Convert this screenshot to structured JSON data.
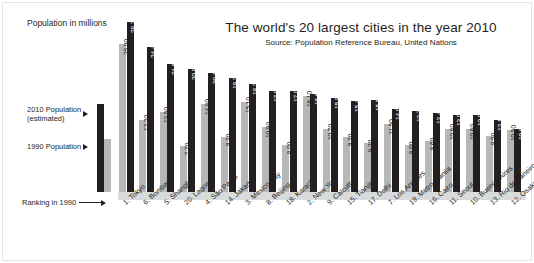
{
  "header": {
    "title": "The world's 20 largest cities in the year 2010",
    "source": "Source: Population Reference Bureau, United Nations"
  },
  "axis": {
    "y_caption": "Population in millions",
    "ranking_caption": "Ranking in 1990"
  },
  "legend": {
    "series_2010_line1": "2010 Population",
    "series_2010_line2": "(estimated)",
    "series_1990": "1990 Population",
    "color_2010": "#231f20",
    "color_1990": "#b6b7b9"
  },
  "chart_data": {
    "type": "bar",
    "title": "The world's 20 largest cities in the year 2010",
    "subtitle": "Source: Population Reference Bureau, United Nations",
    "xlabel": "Ranking in 1990",
    "ylabel": "Population in millions",
    "ylim": [
      0,
      30
    ],
    "grid": false,
    "legend_position": "left",
    "categories": [
      "1. Tokyo",
      "6. Bombay",
      "5. Shanghai",
      "20. Lagos",
      "4. São Paulo",
      "14. Jakarta",
      "3. Mexico City",
      "8. Beijing",
      "18. Karachi",
      "2. New York",
      "9. Calcutta",
      "15. Tianjin",
      "17. Delhi",
      "7. Los Angeles",
      "19. Metro Manila",
      "16. Cairo",
      "11. Seoul",
      "10. Buenos Aires",
      "13. Rio de Janeiro",
      "12. Osaka"
    ],
    "series": [
      {
        "name": "1990 Population",
        "color": "#b6b7b9",
        "values": [
          25.0,
          12.2,
          13.5,
          7.7,
          14.8,
          9.3,
          15.1,
          10.9,
          8.0,
          16.1,
          10.7,
          9.3,
          8.2,
          11.5,
          8.0,
          8.6,
          10.6,
          10.6,
          9.5,
          10.5
        ],
        "labels": [
          "25.00",
          "12.20",
          "13.50",
          "7.70",
          "14.80",
          "9.30",
          "15.10",
          "10.90",
          "8.00",
          "16.10",
          "10.70",
          "9.30",
          "8.20",
          "11.50",
          "8.00",
          "8.60",
          "10.60",
          "10.60",
          "9.50",
          "10.50"
        ]
      },
      {
        "name": "2010 Population (estimated)",
        "color": "#231f20",
        "values": [
          28.7,
          24.4,
          21.5,
          20.8,
          20.1,
          19.2,
          18.2,
          17.0,
          17.0,
          16.6,
          15.9,
          15.4,
          15.5,
          14.0,
          13.7,
          13.4,
          13.0,
          12.9,
          12.1,
          10.6
        ],
        "labels": [
          "28.70",
          "24.40",
          "21.50",
          "20.80",
          "20.10",
          "19.20",
          "18.20",
          "17.00",
          "17.00",
          "16.60",
          "15.90",
          "15.40",
          "15.50",
          "14.00",
          "13.70",
          "13.40",
          "13.00",
          "12.90",
          "12.10",
          "10.60"
        ]
      }
    ]
  }
}
